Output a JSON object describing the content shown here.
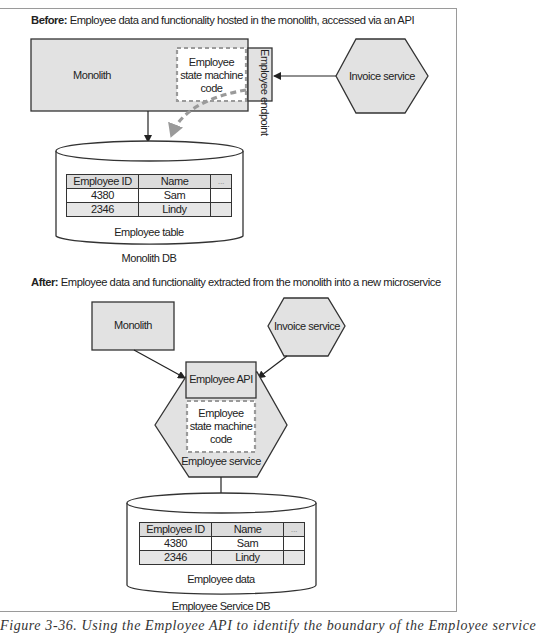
{
  "colors": {
    "shape_fill": "#e2e2e2",
    "stroke": "#333333",
    "dashed_gray": "#9a9a9a",
    "table_header_fill": "#dcdcdc",
    "table_alt_row_fill": "#e6e6e6"
  },
  "before": {
    "heading_bold": "Before:",
    "heading_text": " Employee data and functionality hosted in the monolith, accessed via an API",
    "monolith_label": "Monolith",
    "state_machine_label_1": "Employee",
    "state_machine_label_2": "state machine",
    "state_machine_label_3": "code",
    "endpoint_label": "Employee endpoint",
    "invoice_service_label": "Invoice service",
    "table": {
      "headers": [
        "Employee ID",
        "Name",
        "..."
      ],
      "rows": [
        [
          "4380",
          "Sam",
          ""
        ],
        [
          "2346",
          "Lindy",
          ""
        ]
      ]
    },
    "table_label": "Employee table",
    "db_label": "Monolith DB"
  },
  "after": {
    "heading_bold": "After:",
    "heading_text": " Employee data and functionality extracted from the monolith into a new microservice",
    "monolith_label": "Monolith",
    "invoice_service_label": "Invoice service",
    "api_label": "Employee API",
    "state_machine_label_1": "Employee",
    "state_machine_label_2": "state machine",
    "state_machine_label_3": "code",
    "service_label": "Employee service",
    "table": {
      "headers": [
        "Employee ID",
        "Name",
        "..."
      ],
      "rows": [
        [
          "4380",
          "Sam",
          ""
        ],
        [
          "2346",
          "Lindy",
          ""
        ]
      ]
    },
    "table_label": "Employee data",
    "db_label": "Employee Service DB"
  },
  "caption": "Figure 3-36. Using the Employee API to identify the boundary of the Employee service"
}
